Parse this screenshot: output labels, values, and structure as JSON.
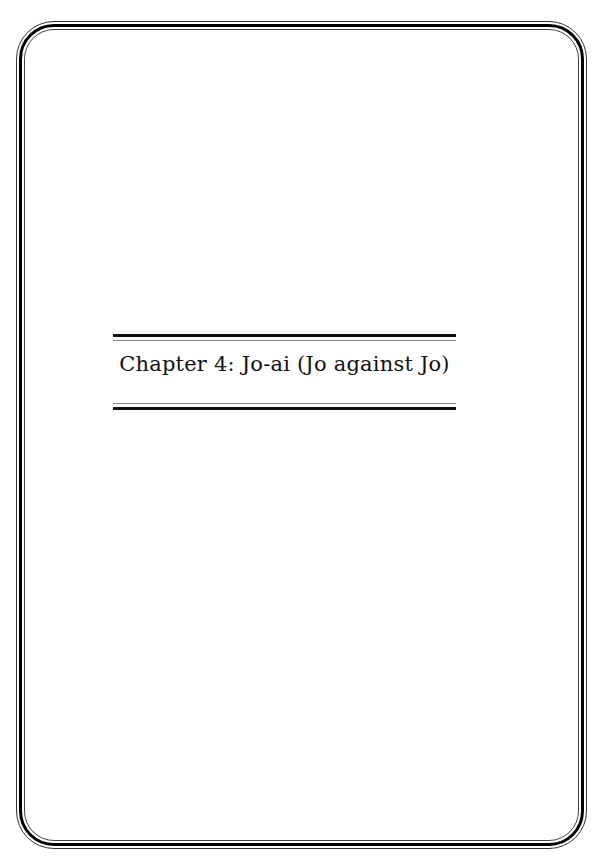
{
  "page": {
    "chapter_title": "Chapter 4: Jo-ai (Jo against Jo)"
  }
}
